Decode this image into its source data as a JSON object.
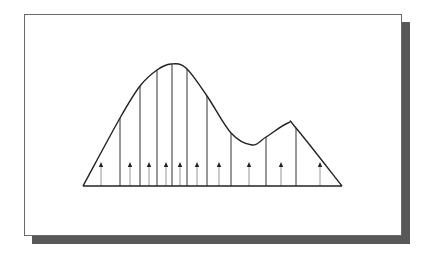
{
  "diagram": {
    "type": "distributed-load-under-curve",
    "colors": {
      "curve": "#222222",
      "baseline": "#222222",
      "divider": "#333333",
      "arrow_shaft": "#a8a8a8",
      "arrow_head": "#222222",
      "frame_border": "#6a6a6a",
      "shadow": "#585858"
    },
    "baseline": {
      "x1": 83,
      "x2": 342,
      "y": 186
    },
    "curve_points": [
      [
        83,
        186
      ],
      [
        120,
        118
      ],
      [
        140,
        86
      ],
      [
        157,
        70
      ],
      [
        171,
        64
      ],
      [
        186,
        68
      ],
      [
        207,
        96
      ],
      [
        231,
        133
      ],
      [
        252,
        145
      ],
      [
        266,
        137
      ],
      [
        288,
        123
      ],
      [
        296,
        128
      ],
      [
        342,
        186
      ]
    ],
    "dividers": [
      {
        "x": 120,
        "top": 118
      },
      {
        "x": 140,
        "top": 86
      },
      {
        "x": 157,
        "top": 70
      },
      {
        "x": 172,
        "top": 64
      },
      {
        "x": 187,
        "top": 69
      },
      {
        "x": 207,
        "top": 96
      },
      {
        "x": 231,
        "top": 133
      },
      {
        "x": 266,
        "top": 137
      },
      {
        "x": 296,
        "top": 128
      }
    ],
    "arrows": [
      {
        "x": 101
      },
      {
        "x": 130
      },
      {
        "x": 149
      },
      {
        "x": 166
      },
      {
        "x": 180
      },
      {
        "x": 197
      },
      {
        "x": 219
      },
      {
        "x": 249
      },
      {
        "x": 281
      },
      {
        "x": 320
      }
    ],
    "arrow_head_y": 164
  }
}
